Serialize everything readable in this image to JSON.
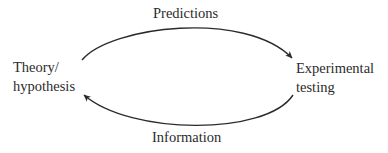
{
  "diagram": {
    "nodes": [
      {
        "id": "theory",
        "lines": [
          "Theory/",
          "hypothesis"
        ]
      },
      {
        "id": "experimental",
        "lines": [
          "Experimental",
          "testing"
        ]
      }
    ],
    "edges": [
      {
        "from": "theory",
        "to": "experimental",
        "label": "Predictions",
        "position": "top"
      },
      {
        "from": "experimental",
        "to": "theory",
        "label": "Information",
        "position": "bottom"
      }
    ],
    "colors": {
      "stroke": "#2b2b2b",
      "text": "#2b2b2b",
      "background": "#ffffff"
    }
  }
}
